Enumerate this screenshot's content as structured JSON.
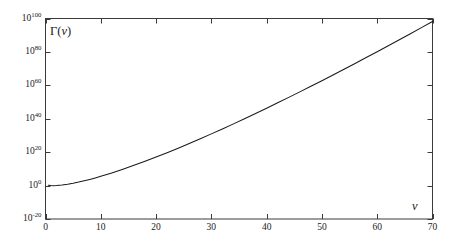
{
  "chart_data": {
    "type": "line",
    "title": "",
    "subtitle": "",
    "xlabel": "v",
    "ylabel": "Γ(v)",
    "yscale": "log",
    "xscale": "linear",
    "xlim": [
      0,
      70
    ],
    "ylim": [
      1e-20,
      1e+100
    ],
    "grid": false,
    "legend": null,
    "x_ticks": [
      0,
      10,
      20,
      30,
      40,
      50,
      60,
      70
    ],
    "x_tick_labels": [
      "0",
      "10",
      "20",
      "30",
      "40",
      "50",
      "60",
      "70"
    ],
    "y_ticks": [
      1e-20,
      1.0,
      1e+20,
      1e+40,
      1e+60,
      1e+80,
      1e+100
    ],
    "y_tick_labels": [
      "10⁻²⁰",
      "10⁰",
      "10²⁰",
      "10⁴⁰",
      "10⁶⁰",
      "10⁸⁰",
      "10¹⁰⁰"
    ],
    "y_tick_mantissa": [
      "10",
      "10",
      "10",
      "10",
      "10",
      "10",
      "10"
    ],
    "y_tick_exponents": [
      "-20",
      "0",
      "20",
      "40",
      "60",
      "80",
      "100"
    ],
    "series": [
      {
        "name": "Γ(v)",
        "color": "#1a1a1a",
        "linewidth": 1.0,
        "x": [
          0.5,
          1,
          1.4616,
          2,
          3,
          4,
          5,
          6,
          7,
          8,
          9,
          10,
          12,
          14,
          16,
          18,
          20,
          22,
          24,
          26,
          28,
          30,
          32,
          34,
          36,
          38,
          40,
          42,
          44,
          46,
          48,
          50,
          52,
          54,
          56,
          58,
          60,
          62,
          64,
          66,
          68,
          70
        ],
        "y_log10": [
          0.2485,
          0.0,
          -0.0855,
          0.0,
          0.301,
          0.7782,
          1.3802,
          2.0792,
          2.8573,
          3.7024,
          4.6055,
          5.5598,
          7.6012,
          9.7943,
          12.1165,
          14.5511,
          17.0851,
          19.7083,
          22.4125,
          25.1906,
          28.037,
          30.9465,
          33.915,
          36.9387,
          40.0142,
          43.1387,
          46.3096,
          49.5244,
          52.7811,
          56.0778,
          59.4127,
          62.7841,
          66.1906,
          69.6309,
          73.1037,
          76.6077,
          80.142,
          83.7055,
          87.2972,
          90.9163,
          94.562,
          98.2334
        ]
      }
    ]
  },
  "figure": {
    "background_color": "#ffffff",
    "frame_color": "#3a3a3a",
    "curve_color": "#1a1a1a",
    "axis_label_y": "Γ(v)",
    "axis_label_x": "v",
    "gamma_symbol": "Γ",
    "nu_symbol": "v"
  }
}
